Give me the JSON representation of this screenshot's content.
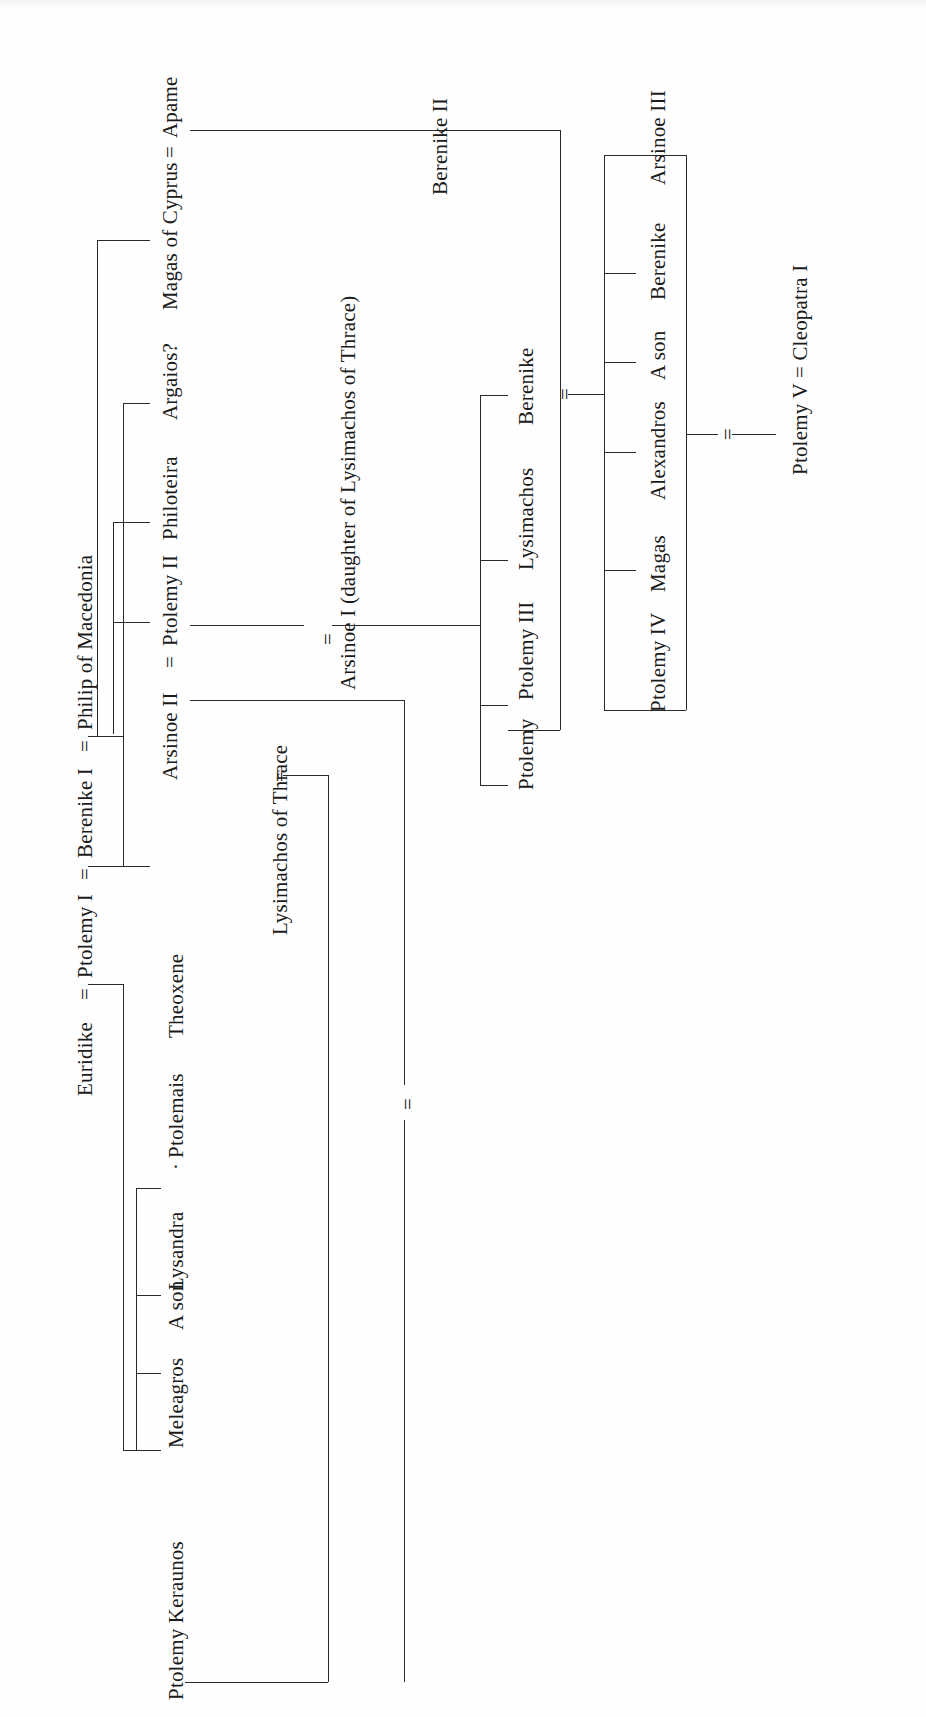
{
  "diagram": {
    "type": "family-tree",
    "title": "",
    "orientation": "rotated-90-counterclockwise",
    "ink_color": "#1b1b1b",
    "background_color": "#fefefe"
  },
  "nodes": {
    "euridike": "Euridike",
    "eq1": "=",
    "ptolemy_i": "Ptolemy I",
    "eq2": "=",
    "berenike_i": "Berenike I",
    "eq3": "=",
    "philip_of_macedonia": "Philip of Macedonia",
    "ptolemy_keraunos": "Ptolemy Keraunos",
    "meleagros": "Meleagros",
    "a_son_1": "A son",
    "lysandra": "Lysandra",
    "middot": "·",
    "ptolemais": "Ptolemais",
    "theoxene": "Theoxene",
    "lysimachos_of_thrace": "Lysimachos of Thrace",
    "eq_lysimachos": "=",
    "eq_marriage_lysimachos_arsinoe": "=",
    "arsinoe_ii": "Arsinoe II",
    "eq4": "=",
    "ptolemy_ii": "Ptolemy II",
    "philoteira": "Philoteira",
    "argaios": "Argaios?",
    "magas_of_cyprus": "Magas of Cyprus",
    "eq5": "=",
    "apame": "Apame",
    "eq_arsinoe_i": "=",
    "arsinoe_i": "Arsinoe I (daughter of Lysimachos of Thrace)",
    "ptolemy": "Ptolemy",
    "ptolemy_iii": "Ptolemy III",
    "lysimachos": "Lysimachos",
    "berenike_a": "Berenike",
    "eq_ptolemyiii_berenikeii": "=",
    "berenike_ii": "Berenike II",
    "ptolemy_iv": "Ptolemy IV",
    "magas": "Magas",
    "alexandros": "Alexandros",
    "a_son_2": "A son",
    "berenike_b": "Berenike",
    "arsinoe_iii": "Arsinoe III",
    "eq_ptolemyiv_arsinoeiii": "=",
    "eq_ptolemyv": "=",
    "ptolemy_v_cleopatra_i": "Ptolemy V = Cleopatra I"
  },
  "generations": [
    {
      "name": "generation-1",
      "members": [
        "Euridike",
        "Ptolemy I",
        "Berenike I",
        "Philip of Macedonia"
      ]
    },
    {
      "name": "generation-2-euridike-children",
      "members": [
        "Ptolemy Keraunos",
        "Meleagros",
        "A son",
        "Lysandra",
        "Ptolemais",
        "Theoxene"
      ]
    },
    {
      "name": "generation-2-berenike-children",
      "members": [
        "Arsinoe II",
        "Ptolemy II",
        "Philoteira",
        "Argaios?"
      ]
    },
    {
      "name": "generation-2-philip-children",
      "members": [
        "Magas of Cyprus"
      ]
    },
    {
      "name": "generation-3",
      "members": [
        "Ptolemy",
        "Ptolemy III",
        "Lysimachos",
        "Berenike",
        "Berenike II"
      ]
    },
    {
      "name": "generation-4",
      "members": [
        "Ptolemy IV",
        "Magas",
        "Alexandros",
        "A son",
        "Berenike",
        "Arsinoe III"
      ]
    },
    {
      "name": "generation-5",
      "members": [
        "Ptolemy V",
        "Cleopatra I"
      ]
    }
  ],
  "marriages": [
    {
      "left": "Euridike",
      "right": "Ptolemy I"
    },
    {
      "left": "Ptolemy I",
      "right": "Berenike I"
    },
    {
      "left": "Berenike I",
      "right": "Philip of Macedonia"
    },
    {
      "left": "Arsinoe II",
      "right": "Ptolemy II"
    },
    {
      "left": "Magas of Cyprus",
      "right": "Apame"
    },
    {
      "left": "Ptolemy II",
      "right": "Arsinoe I (daughter of Lysimachos of Thrace)"
    },
    {
      "left": "Lysimachos of Thrace",
      "right": "Arsinoe II"
    },
    {
      "left": "Ptolemy III",
      "right": "Berenike II"
    },
    {
      "left": "Ptolemy IV",
      "right": "Arsinoe III"
    },
    {
      "left": "Ptolemy V",
      "right": "Cleopatra I"
    }
  ]
}
